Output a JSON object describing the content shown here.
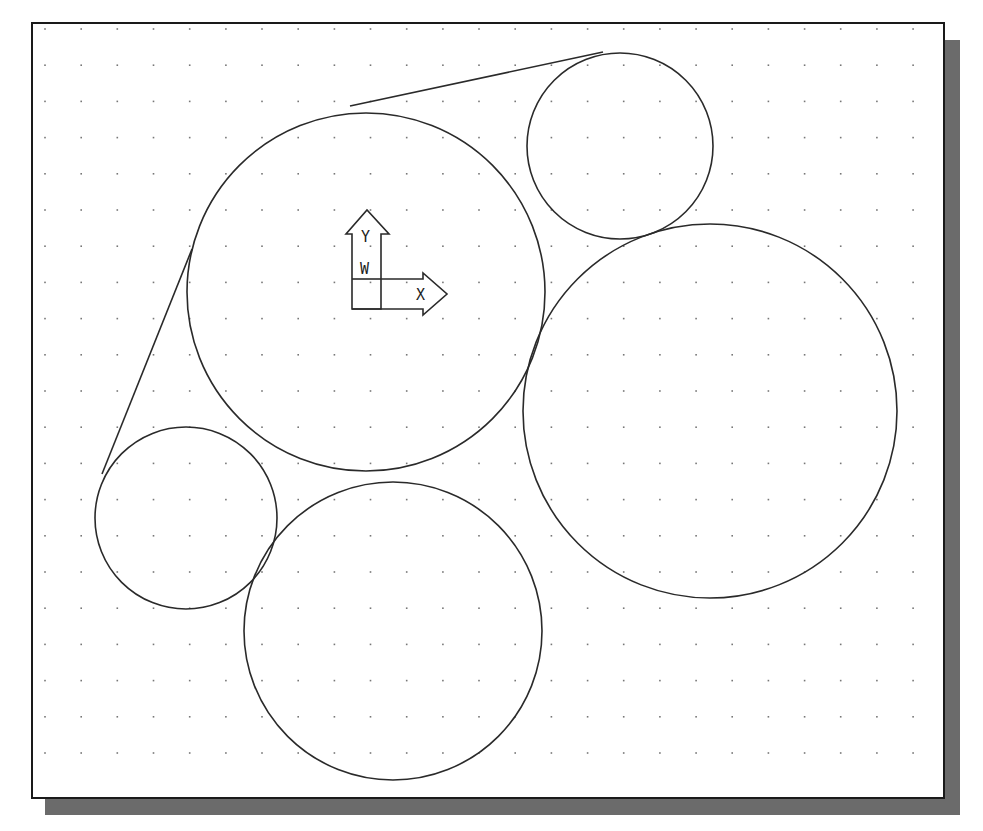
{
  "viewport": {
    "frame": {
      "x": 32,
      "y": 23,
      "width": 912,
      "height": 775
    },
    "shadow": {
      "offset_x": 16,
      "offset_y": 17,
      "color": "#6b6b6b"
    },
    "background": "#ffffff",
    "border_color": "#1a1a1a",
    "grid": {
      "start_x": 45,
      "start_y": 29,
      "spacing_x": 36.17,
      "spacing_y": 36.2,
      "cols": 25,
      "rows": 21,
      "dot_color": "#777777"
    }
  },
  "drawing": {
    "stroke_color": "#2a2a2a",
    "circles": [
      {
        "name": "large-center-circle",
        "cx": 366,
        "cy": 292,
        "r": 179
      },
      {
        "name": "top-right-small-circle",
        "cx": 620,
        "cy": 146,
        "r": 93
      },
      {
        "name": "right-large-circle",
        "cx": 710,
        "cy": 411,
        "r": 187
      },
      {
        "name": "left-small-circle",
        "cx": 186,
        "cy": 518,
        "r": 91
      },
      {
        "name": "bottom-circle",
        "cx": 393,
        "cy": 631,
        "r": 149
      }
    ],
    "lines": [
      {
        "name": "upper-tangent-line",
        "x1": 350,
        "y1": 106,
        "x2": 603,
        "y2": 52
      },
      {
        "name": "left-tangent-line",
        "x1": 192,
        "y1": 249,
        "x2": 102,
        "y2": 474
      }
    ]
  },
  "ucs_icon": {
    "y_label": "Y",
    "x_label": "X",
    "w_label": "W"
  }
}
